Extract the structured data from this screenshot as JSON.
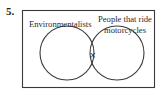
{
  "problem": {
    "number": "5."
  },
  "diagram": {
    "type": "venn",
    "universe_box": {
      "x": 22,
      "y": 10,
      "width": 132,
      "height": 78
    },
    "sets": [
      {
        "name": "Environmentalists",
        "label_lines": [
          "Environmentalists"
        ],
        "circle": {
          "cx": 67,
          "cy": 53,
          "r": 27
        }
      },
      {
        "name": "People that ride motorcycles",
        "label_lines": [
          "People that ride",
          "motorcycles"
        ],
        "circle": {
          "cx": 117,
          "cy": 53,
          "r": 27
        }
      }
    ],
    "marker": {
      "symbol": "×",
      "region": "intersection",
      "x": 92,
      "y": 55
    },
    "colors": {
      "line": "#3a3a3a",
      "text": "#2a2a2a",
      "background": "#ffffff"
    }
  }
}
